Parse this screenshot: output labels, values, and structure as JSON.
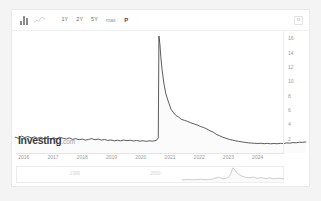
{
  "toolbar": {
    "chart_type_bar_icon": "bar-chart-icon",
    "chart_type_line_icon": "line-chart-icon",
    "timeframes": [
      {
        "label": "1Y",
        "selected": false
      },
      {
        "label": "2Y",
        "selected": false
      },
      {
        "label": "5Y",
        "selected": false
      },
      {
        "label": "max",
        "selected": false
      }
    ],
    "pattern_label": "P",
    "settings_icon": "settings-icon"
  },
  "watermark": {
    "brand": "Investing",
    "suffix": ".com"
  },
  "navigator": {
    "labels": [
      "1990",
      "2000"
    ]
  },
  "colors": {
    "line": "#3c3c3c",
    "fill": "#fbfbfb",
    "axis_text": "#9a9a9a",
    "grid": "#ededed",
    "card": "#ffffff",
    "page": "#f4f4f4"
  },
  "chart_data": {
    "type": "line",
    "title": "",
    "xlabel": "",
    "ylabel": "",
    "xlim": [
      2015.6,
      2024.9
    ],
    "ylim": [
      0,
      17
    ],
    "grid": false,
    "legend": "none",
    "yticks": [
      16,
      14,
      12,
      10,
      8,
      6,
      4,
      2
    ],
    "xticks": [
      2016,
      2017,
      2018,
      2019,
      2020,
      2021,
      2022,
      2023,
      2024
    ],
    "series": [
      {
        "name": "Volatility Index",
        "x": [
          2015.7,
          2015.8,
          2015.9,
          2016.0,
          2016.1,
          2016.2,
          2016.3,
          2016.4,
          2016.5,
          2016.6,
          2016.7,
          2016.8,
          2016.9,
          2017.0,
          2017.1,
          2017.2,
          2017.3,
          2017.4,
          2017.5,
          2017.6,
          2017.7,
          2017.8,
          2017.9,
          2018.0,
          2018.1,
          2018.2,
          2018.3,
          2018.4,
          2018.5,
          2018.6,
          2018.7,
          2018.8,
          2018.9,
          2019.0,
          2019.1,
          2019.2,
          2019.3,
          2019.4,
          2019.5,
          2019.6,
          2019.7,
          2019.8,
          2019.9,
          2020.0,
          2020.05,
          2020.12,
          2020.18,
          2020.2,
          2020.23,
          2020.26,
          2020.3,
          2020.36,
          2020.42,
          2020.5,
          2020.58,
          2020.66,
          2020.74,
          2020.82,
          2020.9,
          2021.0,
          2021.1,
          2021.2,
          2021.3,
          2021.4,
          2021.5,
          2021.6,
          2021.7,
          2021.8,
          2021.9,
          2022.0,
          2022.1,
          2022.2,
          2022.3,
          2022.4,
          2022.5,
          2022.6,
          2022.7,
          2022.8,
          2022.9,
          2023.0,
          2023.1,
          2023.2,
          2023.3,
          2023.4,
          2023.5,
          2023.6,
          2023.7,
          2023.8,
          2023.9,
          2024.0,
          2024.1,
          2024.2,
          2024.3,
          2024.4,
          2024.5,
          2024.6,
          2024.7,
          2024.8
        ],
        "values": [
          2.2,
          2.05,
          2.35,
          2.15,
          2.3,
          2.1,
          2.25,
          2.05,
          2.2,
          2.0,
          2.15,
          1.95,
          2.1,
          2.0,
          2.2,
          2.05,
          1.95,
          2.1,
          1.9,
          2.0,
          1.85,
          1.95,
          1.8,
          1.9,
          2.0,
          1.85,
          1.95,
          1.8,
          1.88,
          1.75,
          1.82,
          1.7,
          1.78,
          1.7,
          1.8,
          1.72,
          1.78,
          1.68,
          1.75,
          1.65,
          1.72,
          1.62,
          1.7,
          1.65,
          1.7,
          1.75,
          2.1,
          16.3,
          15.2,
          13.4,
          11.6,
          9.6,
          8.2,
          7.1,
          6.1,
          5.6,
          5.2,
          5.0,
          4.7,
          4.55,
          4.4,
          4.2,
          4.05,
          3.9,
          3.7,
          3.55,
          3.35,
          3.1,
          2.9,
          2.6,
          2.4,
          2.2,
          2.05,
          1.9,
          1.8,
          1.7,
          1.62,
          1.55,
          1.48,
          1.42,
          1.38,
          1.35,
          1.32,
          1.36,
          1.3,
          1.34,
          1.28,
          1.33,
          1.29,
          1.35,
          1.32,
          1.4,
          1.38,
          1.45,
          1.42,
          1.5,
          1.48,
          1.55
        ]
      }
    ],
    "navigator_series": {
      "name": "overview",
      "x": [
        0.0,
        0.06,
        0.12,
        0.18,
        0.24,
        0.3,
        0.36,
        0.4,
        0.44,
        0.47,
        0.5,
        0.54,
        0.58,
        0.62,
        0.66,
        0.7,
        0.74,
        0.78,
        0.82,
        0.86,
        0.9,
        0.94,
        1.0
      ],
      "values": [
        0.1,
        0.12,
        0.1,
        0.14,
        0.11,
        0.16,
        0.3,
        0.18,
        0.22,
        0.4,
        1.0,
        0.62,
        0.4,
        0.3,
        0.26,
        0.3,
        0.22,
        0.26,
        0.2,
        0.24,
        0.18,
        0.22,
        0.16
      ]
    }
  }
}
